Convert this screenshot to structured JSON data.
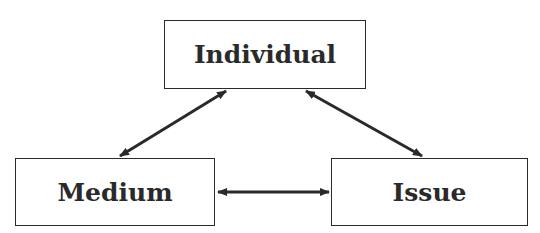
{
  "diagram": {
    "nodes": [
      {
        "id": "individual",
        "label": "Individual"
      },
      {
        "id": "medium",
        "label": "Medium"
      },
      {
        "id": "issue",
        "label": "Issue"
      }
    ],
    "edges": [
      {
        "from": "individual",
        "to": "medium",
        "direction": "bidirectional"
      },
      {
        "from": "individual",
        "to": "issue",
        "direction": "bidirectional"
      },
      {
        "from": "medium",
        "to": "issue",
        "direction": "bidirectional"
      }
    ],
    "colors": {
      "stroke": "#2a2a2a",
      "background": "#ffffff"
    }
  }
}
